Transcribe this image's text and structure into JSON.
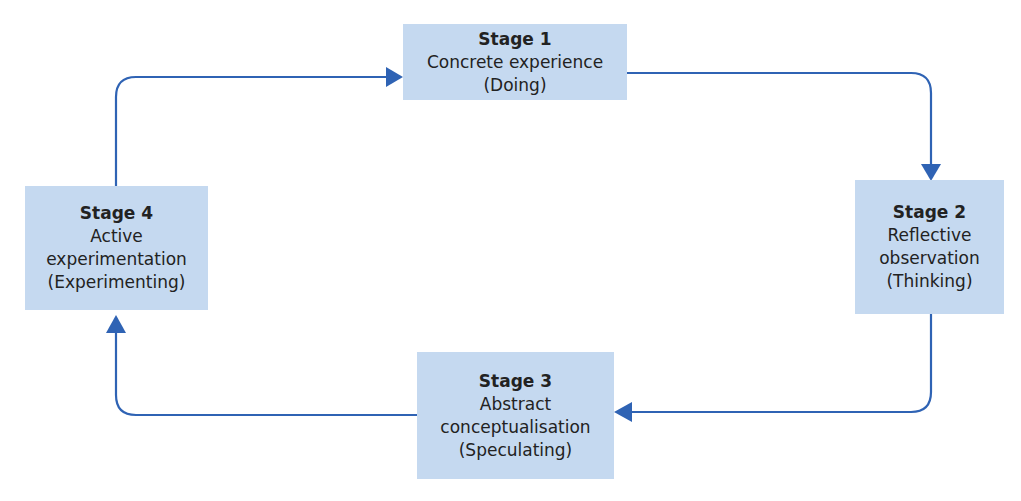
{
  "diagram": {
    "type": "cycle",
    "colors": {
      "box_fill": "#c5d9f0",
      "arrow": "#2f63b4",
      "text": "#222222"
    },
    "stages": [
      {
        "title": "Stage 1",
        "lines": [
          "Concrete experience",
          "(Doing)"
        ]
      },
      {
        "title": "Stage 2",
        "lines": [
          "Reflective",
          "observation",
          "(Thinking)"
        ]
      },
      {
        "title": "Stage 3",
        "lines": [
          "Abstract",
          "conceptualisation",
          "(Speculating)"
        ]
      },
      {
        "title": "Stage 4",
        "lines": [
          "Active",
          "experimentation",
          "(Experimenting)"
        ]
      }
    ],
    "edges": [
      {
        "from": "Stage 1",
        "to": "Stage 2"
      },
      {
        "from": "Stage 2",
        "to": "Stage 3"
      },
      {
        "from": "Stage 3",
        "to": "Stage 4"
      },
      {
        "from": "Stage 4",
        "to": "Stage 1"
      }
    ]
  }
}
